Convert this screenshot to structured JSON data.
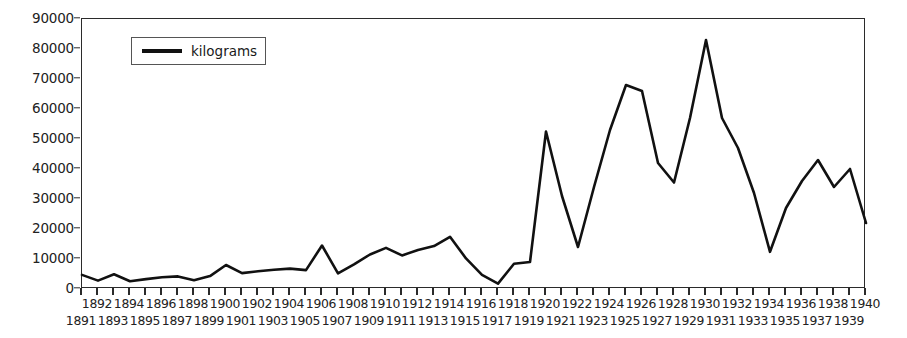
{
  "chart_data": {
    "type": "line",
    "title": "",
    "xlabel": "",
    "ylabel": "",
    "legend_position": "top-left-inside",
    "grid": false,
    "ylim": [
      0,
      90000
    ],
    "ytick_labels": [
      "0",
      "10000",
      "20000",
      "30000",
      "40000",
      "50000",
      "60000",
      "70000",
      "80000",
      "90000"
    ],
    "ytick_values": [
      0,
      10000,
      20000,
      30000,
      40000,
      50000,
      60000,
      70000,
      80000,
      90000
    ],
    "x": [
      1891,
      1892,
      1893,
      1894,
      1895,
      1896,
      1897,
      1898,
      1899,
      1900,
      1901,
      1902,
      1903,
      1904,
      1905,
      1906,
      1907,
      1908,
      1909,
      1910,
      1911,
      1912,
      1913,
      1914,
      1915,
      1916,
      1917,
      1918,
      1919,
      1920,
      1921,
      1922,
      1923,
      1924,
      1925,
      1926,
      1927,
      1928,
      1929,
      1930,
      1931,
      1932,
      1933,
      1934,
      1935,
      1936,
      1937,
      1938,
      1939,
      1940
    ],
    "categories": [
      "1891",
      "1892",
      "1893",
      "1894",
      "1895",
      "1896",
      "1897",
      "1898",
      "1899",
      "1900",
      "1901",
      "1902",
      "1903",
      "1904",
      "1905",
      "1906",
      "1907",
      "1908",
      "1909",
      "1910",
      "1911",
      "1912",
      "1913",
      "1914",
      "1915",
      "1916",
      "1917",
      "1918",
      "1919",
      "1920",
      "1921",
      "1922",
      "1923",
      "1924",
      "1925",
      "1926",
      "1927",
      "1928",
      "1929",
      "1930",
      "1931",
      "1932",
      "1933",
      "1934",
      "1935",
      "1936",
      "1937",
      "1938",
      "1939",
      "1940"
    ],
    "series": [
      {
        "name": "kilograms",
        "color": "#111111",
        "values": [
          4700,
          2800,
          4900,
          2600,
          3300,
          3900,
          4200,
          2900,
          4300,
          8000,
          5300,
          5900,
          6400,
          6800,
          6300,
          14500,
          5200,
          8200,
          11500,
          13700,
          11200,
          13000,
          14300,
          17400,
          10200,
          4700,
          1800,
          8400,
          9000,
          52500,
          31000,
          14000,
          34000,
          53000,
          68000,
          66000,
          42000,
          35500,
          57000,
          83000,
          57000,
          47000,
          32000,
          12400,
          27000,
          36000,
          43000,
          34000,
          40000,
          22000
        ]
      }
    ]
  },
  "legend": {
    "entries": [
      {
        "label": "kilograms"
      }
    ]
  },
  "axes": {
    "x_axis_name": "years",
    "y_axis_name": "kilograms"
  }
}
